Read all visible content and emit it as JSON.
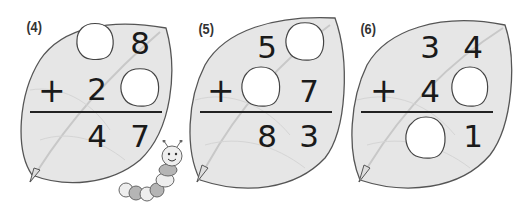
{
  "worksheet": {
    "problems": [
      {
        "label": "(4)",
        "top": {
          "tens": "",
          "ones": "8",
          "blank": [
            "tens"
          ]
        },
        "operator": "+",
        "bottom": {
          "tens": "2",
          "ones": "",
          "blank": [
            "ones"
          ]
        },
        "result": {
          "tens": "4",
          "ones": "7",
          "blank": []
        }
      },
      {
        "label": "(5)",
        "top": {
          "tens": "5",
          "ones": "",
          "blank": [
            "ones"
          ]
        },
        "operator": "+",
        "bottom": {
          "tens": "",
          "ones": "7",
          "blank": [
            "tens"
          ]
        },
        "result": {
          "tens": "8",
          "ones": "3",
          "blank": []
        }
      },
      {
        "label": "(6)",
        "top": {
          "tens": "3",
          "ones": "4",
          "blank": []
        },
        "operator": "+",
        "bottom": {
          "tens": "4",
          "ones": "",
          "blank": [
            "ones"
          ]
        },
        "result": {
          "tens": "",
          "ones": "1",
          "blank": [
            "tens"
          ]
        }
      }
    ],
    "colors": {
      "leaf_fill": "#e6e6e6",
      "leaf_stroke": "#555555",
      "vein": "#c8c8c8",
      "blank_fill": "#ffffff",
      "caterpillar_body_light": "#eeeeee",
      "caterpillar_body_dark": "#b5b5b5"
    },
    "decoration": "caterpillar-icon"
  }
}
